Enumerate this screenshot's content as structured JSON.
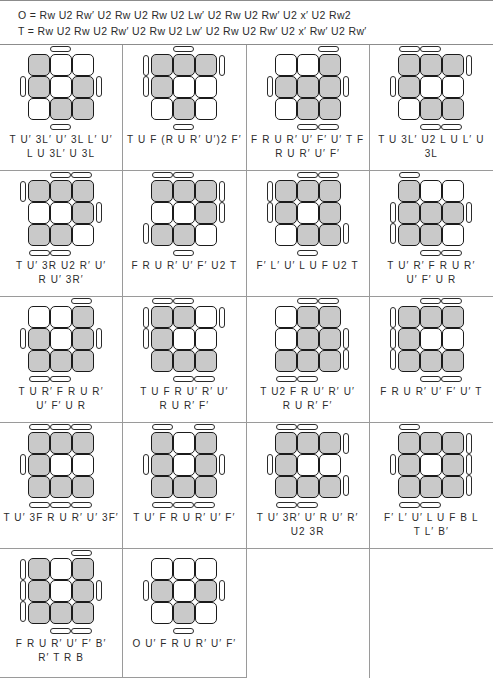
{
  "header": {
    "line_o": "O = Rw U2 Rw′ U2 Rw U2 Rw U2 Lw′ U2 Rw U2 Rw′ U2 x′ U2 Rw2",
    "line_t": "T = Rw U2 Rw U2 Rw′ U2 Rw U2 Lw′ U2 Rw U2 Rw′ U2 x′ Rw′ U2 Rw′"
  },
  "colors": {
    "oriented": "#c9c9c9",
    "unoriented": "#ffffff",
    "outline": "#1b1b1b",
    "rule": "#9a9a9a",
    "text": "#2b2b2b"
  },
  "legend": {
    "gray_meaning": "oriented sticker",
    "white_meaning": "unoriented sticker",
    "bar_meaning": "side sticker facing up"
  },
  "cases": [
    {
      "id": 1,
      "face": [
        [
          "g",
          "w",
          "w"
        ],
        [
          "g",
          "w",
          "g"
        ],
        [
          "w",
          "g",
          "g"
        ]
      ],
      "bars": {
        "top": [
          1
        ],
        "bottom": [
          1
        ],
        "left": [
          1
        ],
        "right": [
          1
        ]
      },
      "alg": "T U′ 3L′ U′ 3L L′ U′\nL U 3L′ U 3L"
    },
    {
      "id": 2,
      "face": [
        [
          "g",
          "g",
          "g"
        ],
        [
          "g",
          "w",
          "w"
        ],
        [
          "w",
          "g",
          "w"
        ]
      ],
      "bars": {
        "top": [
          1
        ],
        "bottom": [
          1
        ],
        "left": [
          0,
          1
        ],
        "right": [
          0
        ]
      },
      "alg": "T U F (R U R′ U′)2 F′"
    },
    {
      "id": 3,
      "face": [
        [
          "w",
          "w",
          "g"
        ],
        [
          "g",
          "g",
          "g"
        ],
        [
          "w",
          "g",
          "g"
        ]
      ],
      "bars": {
        "top": [
          2
        ],
        "bottom": [
          1,
          2
        ],
        "left": [
          1
        ],
        "right": [
          1
        ]
      },
      "alg": "F R U R′ U′ F′ U′ T F\nR U R′ U′ F′"
    },
    {
      "id": 4,
      "face": [
        [
          "g",
          "g",
          "g"
        ],
        [
          "g",
          "w",
          "w"
        ],
        [
          "w",
          "g",
          "g"
        ]
      ],
      "bars": {
        "top": [
          0,
          1
        ],
        "bottom": [
          1,
          2
        ],
        "left": [
          1
        ],
        "right": [
          0
        ]
      },
      "alg": "T U 3L′ U2 L U L′ U 3L"
    },
    {
      "id": 5,
      "face": [
        [
          "g",
          "g",
          "g"
        ],
        [
          "w",
          "w",
          "g"
        ],
        [
          "g",
          "g",
          "w"
        ]
      ],
      "bars": {
        "top": [
          1,
          2
        ],
        "bottom": [
          0,
          1
        ],
        "left": [
          0
        ],
        "right": [
          1
        ]
      },
      "alg": "T U′ 3R U2 R′ U′\nR U′ 3R′"
    },
    {
      "id": 6,
      "face": [
        [
          "g",
          "g",
          "g"
        ],
        [
          "w",
          "w",
          "g"
        ],
        [
          "g",
          "g",
          "w"
        ]
      ],
      "bars": {
        "top": [
          0,
          1
        ],
        "bottom": [
          1
        ],
        "left": [
          2
        ],
        "right": [
          0,
          1
        ]
      },
      "alg": "F R U R′ U′ F′ U2 T"
    },
    {
      "id": 7,
      "face": [
        [
          "g",
          "g",
          "g"
        ],
        [
          "g",
          "w",
          "g"
        ],
        [
          "w",
          "g",
          "g"
        ]
      ],
      "bars": {
        "top": [
          1,
          2
        ],
        "bottom": [
          1
        ],
        "left": [
          0,
          1
        ],
        "right": [
          2
        ]
      },
      "alg": "F′ L′ U′ L U F U2 T"
    },
    {
      "id": 8,
      "face": [
        [
          "g",
          "w",
          "w"
        ],
        [
          "g",
          "g",
          "g"
        ],
        [
          "g",
          "g",
          "w"
        ]
      ],
      "bars": {
        "top": [
          0
        ],
        "bottom": [
          1,
          2
        ],
        "left": [
          1,
          2
        ],
        "right": [
          1
        ]
      },
      "alg": "T U′ R′ F R U R′\nU′ F′ U R"
    },
    {
      "id": 9,
      "face": [
        [
          "w",
          "w",
          "g"
        ],
        [
          "g",
          "w",
          "g"
        ],
        [
          "g",
          "g",
          "g"
        ]
      ],
      "bars": {
        "top": [
          2
        ],
        "bottom": [
          0,
          1
        ],
        "left": [
          1
        ],
        "right": [
          1
        ]
      },
      "alg": "T U R′ F R U R′\nU′ F′ U R"
    },
    {
      "id": 10,
      "face": [
        [
          "g",
          "g",
          "w"
        ],
        [
          "g",
          "w",
          "w"
        ],
        [
          "g",
          "g",
          "g"
        ]
      ],
      "bars": {
        "top": [
          0,
          1
        ],
        "bottom": [
          1,
          2
        ],
        "left": [
          0,
          1
        ],
        "right": [
          0
        ]
      },
      "alg": "T U F R U′ R′ U′\nR U R′ F′"
    },
    {
      "id": 11,
      "face": [
        [
          "w",
          "g",
          "g"
        ],
        [
          "w",
          "g",
          "g"
        ],
        [
          "g",
          "g",
          "g"
        ]
      ],
      "bars": {
        "top": [
          1,
          2
        ],
        "bottom": [
          0,
          1
        ],
        "left": [],
        "right": [
          1,
          2
        ]
      },
      "alg": "T U2 F R U′ R′ U′\nR U R′ F′"
    },
    {
      "id": 12,
      "face": [
        [
          "g",
          "g",
          "g"
        ],
        [
          "g",
          "w",
          "w"
        ],
        [
          "g",
          "g",
          "g"
        ]
      ],
      "bars": {
        "top": [
          1,
          2
        ],
        "bottom": [
          1,
          2
        ],
        "left": [
          0,
          1,
          2
        ],
        "right": []
      },
      "alg": "F R U R′ U′ F′ U′ T"
    },
    {
      "id": 13,
      "face": [
        [
          "g",
          "g",
          "g"
        ],
        [
          "g",
          "w",
          "w"
        ],
        [
          "g",
          "g",
          "g"
        ]
      ],
      "bars": {
        "top": [
          0,
          1,
          2
        ],
        "bottom": [
          0,
          1,
          2
        ],
        "left": [
          1
        ],
        "right": []
      },
      "alg": "T U′ 3F R U R′ U′ 3F′"
    },
    {
      "id": 14,
      "face": [
        [
          "g",
          "w",
          "g"
        ],
        [
          "g",
          "w",
          "g"
        ],
        [
          "g",
          "g",
          "g"
        ]
      ],
      "bars": {
        "top": [
          0,
          2
        ],
        "bottom": [
          0,
          1,
          2
        ],
        "left": [
          1
        ],
        "right": [
          1
        ]
      },
      "alg": "T U′ F R U R′ U′ F′"
    },
    {
      "id": 15,
      "face": [
        [
          "g",
          "g",
          "g"
        ],
        [
          "g",
          "w",
          "w"
        ],
        [
          "g",
          "g",
          "g"
        ]
      ],
      "bars": {
        "top": [
          0,
          1
        ],
        "bottom": [
          0,
          1
        ],
        "left": [
          1
        ],
        "right": [
          0,
          2
        ]
      },
      "alg": "T U′ 3R′ U′ R U′ R′\nU2 3R"
    },
    {
      "id": 16,
      "face": [
        [
          "g",
          "g",
          "g"
        ],
        [
          "g",
          "w",
          "g"
        ],
        [
          "g",
          "g",
          "g"
        ]
      ],
      "bars": {
        "top": [
          0
        ],
        "bottom": [
          0,
          1
        ],
        "left": [
          1
        ],
        "right": [
          0,
          1,
          2
        ]
      },
      "alg": "F′ L′ U′ L U F B L\nT L′ B′"
    },
    {
      "id": 17,
      "face": [
        [
          "g",
          "w",
          "g"
        ],
        [
          "g",
          "w",
          "g"
        ],
        [
          "g",
          "g",
          "g"
        ]
      ],
      "bars": {
        "top": [
          2
        ],
        "bottom": [
          1,
          2
        ],
        "left": [
          0,
          1,
          2
        ],
        "right": [
          1
        ]
      },
      "alg": "F R U R′ U′ F′ B′\nR′ T R B"
    },
    {
      "id": 18,
      "face": [
        [
          "w",
          "w",
          "w"
        ],
        [
          "g",
          "w",
          "g"
        ],
        [
          "w",
          "g",
          "w"
        ]
      ],
      "bars": {
        "top": [],
        "bottom": [
          1
        ],
        "left": [
          1
        ],
        "right": [
          1
        ]
      },
      "alg": "O U′ F R U R′ U′ F′"
    }
  ]
}
